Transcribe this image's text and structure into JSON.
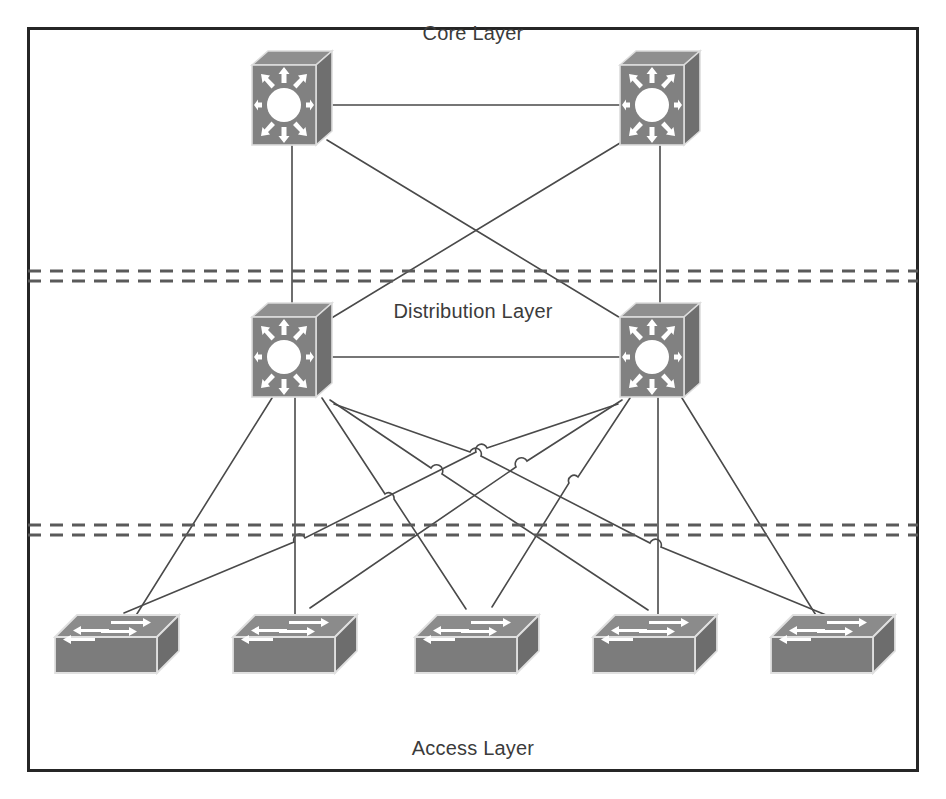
{
  "diagram": {
    "title_visible": false,
    "background_color": "#ffffff",
    "frame": {
      "name": "outer-border",
      "x": 27,
      "y": 27,
      "width": 891,
      "height": 744,
      "stroke": "#262626",
      "stroke_width": 3
    },
    "labels": [
      {
        "id": "core",
        "text": "Core Layer",
        "x": 473,
        "y": 40
      },
      {
        "id": "distribution",
        "text": "Distribution Layer",
        "x": 473,
        "y": 318
      },
      {
        "id": "access",
        "text": "Access Layer",
        "x": 473,
        "y": 755
      }
    ],
    "dividers": [
      {
        "id": "core-distribution-divider",
        "y": 271,
        "gap": 10
      },
      {
        "id": "distribution-access-divider",
        "y": 525,
        "gap": 10
      }
    ],
    "divider_style": {
      "stroke": "#5a5a5a",
      "stroke_width": 3,
      "dash": "13 9"
    },
    "link_style": {
      "stroke": "#4a4a4a",
      "stroke_width": 1.6
    },
    "icon_colors": {
      "body": "#7f7f7f",
      "top": "#8c8c8c",
      "side": "#6b6b6b",
      "edge": "#d9d9d9",
      "glyph": "#ffffff",
      "outline": "#5c5c5c"
    },
    "nodes": {
      "core": [
        {
          "id": "core-switch-1",
          "label": "Core Switch 1",
          "x": 292,
          "y": 105,
          "type": "multilayer-switch"
        },
        {
          "id": "core-switch-2",
          "label": "Core Switch 2",
          "x": 660,
          "y": 105,
          "type": "multilayer-switch"
        }
      ],
      "distribution": [
        {
          "id": "distribution-switch-1",
          "label": "Distribution Switch 1",
          "x": 292,
          "y": 357,
          "type": "multilayer-switch"
        },
        {
          "id": "distribution-switch-2",
          "label": "Distribution Switch 2",
          "x": 660,
          "y": 357,
          "type": "multilayer-switch"
        }
      ],
      "access": [
        {
          "id": "access-switch-1",
          "label": "Access Switch 1",
          "x": 117,
          "y": 645,
          "type": "workgroup-switch"
        },
        {
          "id": "access-switch-2",
          "label": "Access Switch 2",
          "x": 295,
          "y": 645,
          "type": "workgroup-switch"
        },
        {
          "id": "access-switch-3",
          "label": "Access Switch 3",
          "x": 477,
          "y": 645,
          "type": "workgroup-switch"
        },
        {
          "id": "access-switch-4",
          "label": "Access Switch 4",
          "x": 655,
          "y": 645,
          "type": "workgroup-switch"
        },
        {
          "id": "access-switch-5",
          "label": "Access Switch 5",
          "x": 833,
          "y": 645,
          "type": "workgroup-switch"
        }
      ]
    },
    "links": [
      {
        "id": "link-core1-core2",
        "from": "core-switch-1",
        "to": "core-switch-2",
        "kind": "core-peer"
      },
      {
        "id": "link-core1-dist1",
        "from": "core-switch-1",
        "to": "distribution-switch-1",
        "kind": "core-to-distribution"
      },
      {
        "id": "link-core1-dist2",
        "from": "core-switch-1",
        "to": "distribution-switch-2",
        "kind": "core-to-distribution"
      },
      {
        "id": "link-core2-dist1",
        "from": "core-switch-2",
        "to": "distribution-switch-1",
        "kind": "core-to-distribution"
      },
      {
        "id": "link-core2-dist2",
        "from": "core-switch-2",
        "to": "distribution-switch-2",
        "kind": "core-to-distribution"
      },
      {
        "id": "link-dist1-dist2",
        "from": "distribution-switch-1",
        "to": "distribution-switch-2",
        "kind": "distribution-peer"
      },
      {
        "id": "link-dist1-acc1",
        "from": "distribution-switch-1",
        "to": "access-switch-1",
        "kind": "distribution-to-access"
      },
      {
        "id": "link-dist1-acc2",
        "from": "distribution-switch-1",
        "to": "access-switch-2",
        "kind": "distribution-to-access"
      },
      {
        "id": "link-dist1-acc3",
        "from": "distribution-switch-1",
        "to": "access-switch-3",
        "kind": "distribution-to-access"
      },
      {
        "id": "link-dist1-acc4",
        "from": "distribution-switch-1",
        "to": "access-switch-4",
        "kind": "distribution-to-access"
      },
      {
        "id": "link-dist1-acc5",
        "from": "distribution-switch-1",
        "to": "access-switch-5",
        "kind": "distribution-to-access"
      },
      {
        "id": "link-dist2-acc1",
        "from": "distribution-switch-2",
        "to": "access-switch-1",
        "kind": "distribution-to-access"
      },
      {
        "id": "link-dist2-acc2",
        "from": "distribution-switch-2",
        "to": "access-switch-2",
        "kind": "distribution-to-access"
      },
      {
        "id": "link-dist2-acc3",
        "from": "distribution-switch-2",
        "to": "access-switch-3",
        "kind": "distribution-to-access"
      },
      {
        "id": "link-dist2-acc4",
        "from": "distribution-switch-2",
        "to": "access-switch-4",
        "kind": "distribution-to-access"
      },
      {
        "id": "link-dist2-acc5",
        "from": "distribution-switch-2",
        "to": "access-switch-5",
        "kind": "distribution-to-access"
      }
    ],
    "counts": {
      "core_switches": 2,
      "distribution_switches": 2,
      "access_switches": 5
    }
  }
}
